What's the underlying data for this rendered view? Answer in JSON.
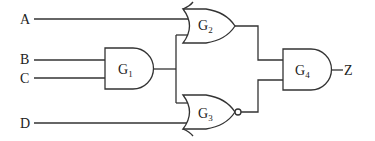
{
  "inputs": {
    "a": "A",
    "b": "B",
    "c": "C",
    "d": "D"
  },
  "output": "Z",
  "gates": {
    "g1": {
      "name": "G",
      "sub": "1",
      "type": "AND"
    },
    "g2": {
      "name": "G",
      "sub": "2",
      "type": "OR"
    },
    "g3": {
      "name": "G",
      "sub": "3",
      "type": "NOR"
    },
    "g4": {
      "name": "G",
      "sub": "4",
      "type": "AND"
    }
  }
}
